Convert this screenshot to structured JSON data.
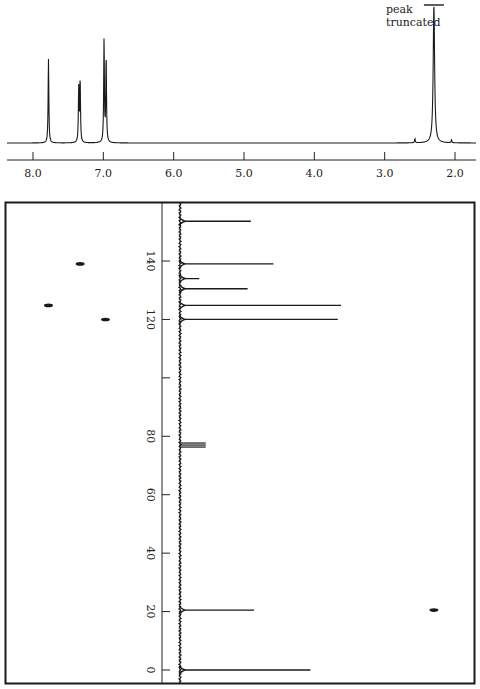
{
  "chart_data": [
    {
      "type": "line",
      "title": "",
      "description": "1H NMR spectrum (projection along top)",
      "xlabel": "",
      "ylabel": "",
      "x_reversed": true,
      "xlim": [
        8.35,
        1.75
      ],
      "x_ticks": [
        8.0,
        7.0,
        6.0,
        5.0,
        4.0,
        3.0,
        2.0
      ],
      "x_tick_labels": [
        "8.0",
        "7.0",
        "6.0",
        "5.0",
        "4.0",
        "3.0",
        "2.0"
      ],
      "grid": false,
      "peaks": [
        {
          "ppm": 7.78,
          "rel_height": 0.61
        },
        {
          "ppm": 7.35,
          "rel_height": 0.39
        },
        {
          "ppm": 7.33,
          "rel_height": 0.45
        },
        {
          "ppm": 6.99,
          "rel_height": 0.74
        },
        {
          "ppm": 6.96,
          "rel_height": 0.61
        },
        {
          "ppm": 2.57,
          "rel_height": 0.03
        },
        {
          "ppm": 2.3,
          "rel_height": 1.0,
          "truncated": true
        },
        {
          "ppm": 2.05,
          "rel_height": 0.02
        }
      ],
      "annotations": [
        {
          "text_line1": "peak",
          "text_line2": "truncated",
          "near_ppm": 2.3
        }
      ]
    },
    {
      "type": "line",
      "title": "",
      "description": "13C NMR spectrum (projection along vertical axis, peaks drawn horizontally)",
      "ylabel": "",
      "ylim": [
        -3,
        162
      ],
      "y_ticks": [
        0,
        20,
        40,
        60,
        80,
        100,
        120,
        140
      ],
      "y_tick_labels": [
        "0",
        "20",
        "40",
        "60",
        "80",
        "",
        "120",
        "140"
      ],
      "grid": false,
      "peaks": [
        {
          "ppm": 153.6,
          "rel_height": 0.44
        },
        {
          "ppm": 139.0,
          "rel_height": 0.58
        },
        {
          "ppm": 134.0,
          "rel_height": 0.12
        },
        {
          "ppm": 130.5,
          "rel_height": 0.42
        },
        {
          "ppm": 124.8,
          "rel_height": 1.0
        },
        {
          "ppm": 120.0,
          "rel_height": 0.98
        },
        {
          "ppm": 77.0,
          "rel_height": 0.16,
          "label": "solvent triplet"
        },
        {
          "ppm": 20.5,
          "rel_height": 0.46
        },
        {
          "ppm": 0.0,
          "rel_height": 0.81
        }
      ]
    },
    {
      "type": "scatter",
      "title": "",
      "description": "2D 1H-13C heteronuclear correlation cross peaks",
      "xlabel": "1H (ppm)",
      "ylabel": "13C (ppm)",
      "points": [
        {
          "h_ppm": 7.33,
          "c_ppm": 139.0
        },
        {
          "h_ppm": 7.78,
          "c_ppm": 124.8
        },
        {
          "h_ppm": 6.97,
          "c_ppm": 120.0
        },
        {
          "h_ppm": 2.3,
          "c_ppm": 20.5
        }
      ]
    }
  ],
  "labels": {
    "peak_note_line1": "peak",
    "peak_note_line2": "truncated",
    "h_ticks": [
      "8.0",
      "7.0",
      "6.0",
      "5.0",
      "4.0",
      "3.0",
      "2.0"
    ],
    "c_ticks": [
      "0",
      "20",
      "40",
      "60",
      "80",
      "120",
      "140"
    ]
  },
  "colors": {
    "ink": "#1a1a1a",
    "background": "#ffffff"
  }
}
